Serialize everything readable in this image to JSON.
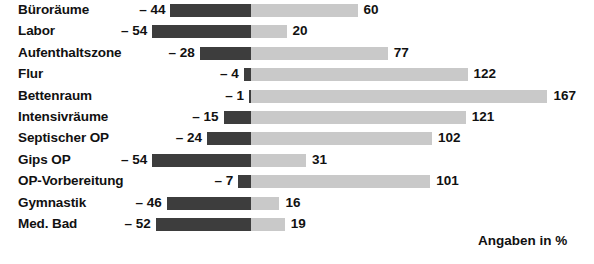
{
  "chart": {
    "footnote": "Angaben in %",
    "colors": {
      "negative_bar": "#3d3d3d",
      "positive_bar": "#c9c9c9",
      "text": "#111111",
      "background": "#ffffff"
    }
  },
  "chart_data": {
    "type": "bar",
    "orientation": "horizontal",
    "style": "diverging",
    "title": "",
    "subtitle": "",
    "xlabel": "",
    "ylabel": "",
    "annotations": [
      "Angaben in %"
    ],
    "grid": false,
    "legend_position": "none",
    "xlim": [
      -60,
      175
    ],
    "zero_baseline": 0,
    "categories": [
      "Büroräume",
      "Labor",
      "Aufenthaltszone",
      "Flur",
      "Bettenraum",
      "Intensivräume",
      "Septischer OP",
      "Gips OP",
      "OP-Vorbereitung",
      "Gymnastik",
      "Med. Bad"
    ],
    "series": [
      {
        "name": "negative",
        "values": [
          -44,
          -54,
          -28,
          -4,
          -1,
          -15,
          -24,
          -54,
          -7,
          -46,
          -52
        ],
        "labels": [
          "– 44",
          "– 54",
          "– 28",
          "– 4",
          "– 1",
          "– 15",
          "– 24",
          "– 54",
          "– 7",
          "– 46",
          "– 52"
        ],
        "color": "#3d3d3d"
      },
      {
        "name": "positive",
        "values": [
          60,
          20,
          77,
          122,
          167,
          121,
          102,
          31,
          101,
          16,
          19
        ],
        "labels": [
          "60",
          "20",
          "77",
          "122",
          "167",
          "121",
          "102",
          "31",
          "101",
          "16",
          "19"
        ],
        "color": "#c9c9c9"
      }
    ]
  }
}
